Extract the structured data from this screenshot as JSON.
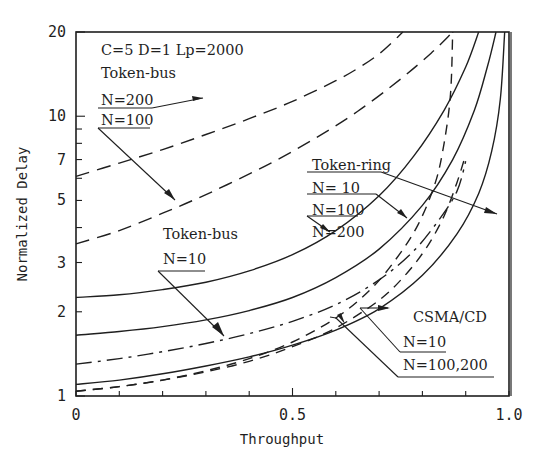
{
  "chart_data": {
    "type": "line",
    "title": "",
    "xlabel": "Throughput",
    "ylabel": "Normalized Delay",
    "xlim": [
      0,
      1.0
    ],
    "ylim": [
      1,
      20
    ],
    "yscale": "log",
    "grid": false,
    "x_ticks": [
      0,
      0.1,
      0.2,
      0.3,
      0.4,
      0.5,
      0.6,
      0.7,
      0.8,
      0.9,
      1.0
    ],
    "x_tick_labels": [
      {
        "value": 0,
        "label": "0"
      },
      {
        "value": 0.5,
        "label": "0.5"
      },
      {
        "value": 1.0,
        "label": "1.0"
      }
    ],
    "y_ticks": [
      1,
      2,
      3,
      4,
      5,
      6,
      7,
      8,
      9,
      10,
      20
    ],
    "y_tick_labels": [
      {
        "value": 1,
        "label": "1"
      },
      {
        "value": 2,
        "label": "2"
      },
      {
        "value": 3,
        "label": "3"
      },
      {
        "value": 5,
        "label": "5"
      },
      {
        "value": 7,
        "label": "7"
      },
      {
        "value": 10,
        "label": "10"
      },
      {
        "value": 20,
        "label": "20"
      }
    ],
    "parameters_annotation": "C=5 D=1 Lp=2000",
    "series": [
      {
        "name": "Token-bus N=200",
        "protocol": "Token-bus",
        "N": "200",
        "style": "long-dash",
        "x": [
          0,
          0.1,
          0.2,
          0.3,
          0.4,
          0.5,
          0.6,
          0.65,
          0.7,
          0.755
        ],
        "y": [
          6.1,
          6.8,
          7.6,
          8.6,
          9.8,
          11.3,
          13.4,
          14.8,
          16.7,
          20
        ]
      },
      {
        "name": "Token-bus N=100",
        "protocol": "Token-bus",
        "N": "100",
        "style": "long-dash",
        "x": [
          0,
          0.1,
          0.2,
          0.27,
          0.35,
          0.45,
          0.55,
          0.65,
          0.75,
          0.82,
          0.87
        ],
        "y": [
          3.5,
          3.9,
          4.5,
          5.0,
          5.7,
          6.8,
          8.3,
          10.4,
          13.6,
          16.8,
          20
        ]
      },
      {
        "name": "Token-bus N=10",
        "protocol": "Token-bus",
        "N": "10",
        "style": "dash-dot",
        "x": [
          0,
          0.1,
          0.2,
          0.3,
          0.4,
          0.5,
          0.6,
          0.7,
          0.78,
          0.84,
          0.88,
          0.9
        ],
        "y": [
          1.3,
          1.36,
          1.44,
          1.54,
          1.67,
          1.85,
          2.12,
          2.6,
          3.3,
          4.3,
          5.4,
          6.9
        ]
      },
      {
        "name": "Token-ring N=200",
        "protocol": "Token-ring",
        "N": "200",
        "style": "solid",
        "x": [
          0,
          0.1,
          0.2,
          0.3,
          0.4,
          0.5,
          0.6,
          0.7,
          0.78,
          0.85,
          0.9,
          0.93
        ],
        "y": [
          2.25,
          2.3,
          2.4,
          2.55,
          2.8,
          3.2,
          3.9,
          5.2,
          7.2,
          10.5,
          15,
          20
        ]
      },
      {
        "name": "Token-ring N=100",
        "protocol": "Token-ring",
        "N": "100",
        "style": "solid",
        "x": [
          0,
          0.1,
          0.2,
          0.3,
          0.4,
          0.5,
          0.6,
          0.7,
          0.8,
          0.87,
          0.92,
          0.95,
          0.97
        ],
        "y": [
          1.65,
          1.7,
          1.77,
          1.87,
          2.02,
          2.25,
          2.65,
          3.35,
          4.8,
          7.0,
          10.5,
          15,
          20
        ]
      },
      {
        "name": "Token-ring N=10",
        "protocol": "Token-ring",
        "N": "10",
        "style": "solid",
        "x": [
          0,
          0.1,
          0.2,
          0.3,
          0.4,
          0.5,
          0.6,
          0.7,
          0.8,
          0.88,
          0.93,
          0.96,
          0.98,
          0.99
        ],
        "y": [
          1.1,
          1.14,
          1.2,
          1.28,
          1.38,
          1.52,
          1.72,
          2.05,
          2.7,
          3.8,
          5.3,
          7.5,
          11.5,
          20
        ]
      },
      {
        "name": "CSMA/CD N=10",
        "protocol": "CSMA/CD",
        "N": "10",
        "style": "dashed",
        "x": [
          0,
          0.1,
          0.2,
          0.3,
          0.4,
          0.5,
          0.6,
          0.7,
          0.76,
          0.81,
          0.85,
          0.88,
          0.9
        ],
        "y": [
          1.04,
          1.08,
          1.14,
          1.22,
          1.33,
          1.5,
          1.75,
          2.2,
          2.7,
          3.4,
          4.4,
          5.8,
          7.3
        ]
      },
      {
        "name": "CSMA/CD N=100,200",
        "protocol": "CSMA/CD",
        "N": "100,200",
        "style": "dashed",
        "x": [
          0,
          0.1,
          0.2,
          0.3,
          0.4,
          0.5,
          0.6,
          0.68,
          0.74,
          0.79,
          0.83,
          0.85,
          0.865,
          0.87
        ],
        "y": [
          1.04,
          1.08,
          1.14,
          1.23,
          1.36,
          1.56,
          1.9,
          2.4,
          3.1,
          4.1,
          5.8,
          8.0,
          12.0,
          20
        ]
      }
    ],
    "annotations": [
      {
        "text": "C=5 D=1 Lp=2000"
      },
      {
        "text": "Token-bus"
      },
      {
        "text": "N=200"
      },
      {
        "text": "N=100"
      },
      {
        "text": "Token-bus"
      },
      {
        "text": "N=10"
      },
      {
        "text": "Token-ring"
      },
      {
        "text": "N= 10"
      },
      {
        "text": "N=100"
      },
      {
        "text": "N=200"
      },
      {
        "text": "CSMA/CD"
      },
      {
        "text": "N=10"
      },
      {
        "text": "N=100,200"
      }
    ]
  },
  "labels": {
    "params": "C=5 D=1 Lp=2000",
    "tokenbus_top": "Token-bus",
    "tokenbus_top_n200": "N=200",
    "tokenbus_top_n100": "N=100",
    "tokenbus_mid": "Token-bus",
    "tokenbus_mid_n10": "N=10",
    "tokenring": "Token-ring",
    "tokenring_n10": "N= 10",
    "tokenring_n100": "N=100",
    "tokenring_n200": "N=200",
    "csmacd": "CSMA/CD",
    "csmacd_n10": "N=10",
    "csmacd_n100_200": "N=100,200",
    "xlabel": "Throughput",
    "ylabel": "Normalized Delay"
  }
}
